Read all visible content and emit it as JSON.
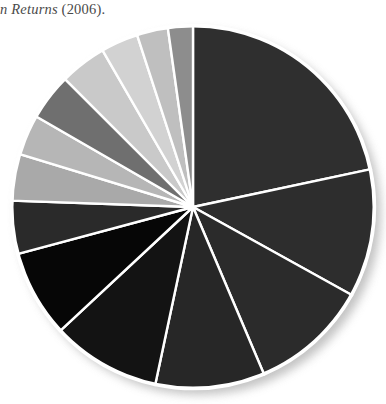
{
  "caption": {
    "italic_part": "n Returns",
    "plain_part": " (2006)."
  },
  "figure": {
    "name": "grayscale-pie-chart",
    "center_x": 186,
    "center_y": 186,
    "radius": 182,
    "divider_color": "#ffffff",
    "divider_width": 2.4,
    "rim_color": "#ffffff",
    "background": "#ffffff",
    "shadow_color": "#b9b9b9"
  },
  "chart_data": {
    "type": "pie",
    "title": "",
    "subtitle": "",
    "xlabel": "",
    "ylabel": "",
    "legend_position": "none",
    "grid": false,
    "start_angle_deg": 0,
    "direction": "clockwise",
    "units": "percent",
    "total": 100,
    "categories": [
      "Slice 1",
      "Slice 2",
      "Slice 3",
      "Slice 4",
      "Slice 5",
      "Slice 6",
      "Slice 7",
      "Slice 8",
      "Slice 9",
      "Slice 10",
      "Slice 11",
      "Slice 12",
      "Slice 13"
    ],
    "values": [
      21.7,
      11.4,
      10.6,
      9.7,
      9.7,
      7.8,
      4.7,
      4.2,
      3.6,
      4.2,
      4.2,
      3.3,
      2.8
    ],
    "angles_deg": [
      78.0,
      41.0,
      38.0,
      35.0,
      35.0,
      28.0,
      17.0,
      15.0,
      13.0,
      15.0,
      15.0,
      12.0,
      10.0
    ],
    "boundaries_deg": [
      0,
      78,
      119,
      157,
      192,
      227,
      255,
      272,
      287,
      300,
      315,
      330,
      342,
      352
    ],
    "colors": [
      "#2f2f2f",
      "#2d2d2d",
      "#2b2b2b",
      "#272727",
      "#1a1a1a",
      "#070707",
      "#262626",
      "#a8a8a8",
      "#b5b5b5",
      "#6d6d6d",
      "#c8c8c8",
      "#cdcdcd",
      "#bdbdbd",
      "#8e8e8e"
    ],
    "slices": [
      {
        "label": "Slice 1",
        "value": 21.7,
        "angle_deg": 78.0,
        "start_deg": 0,
        "end_deg": 78,
        "color": "#2f2f2f"
      },
      {
        "label": "Slice 2",
        "value": 11.4,
        "angle_deg": 41.0,
        "start_deg": 78,
        "end_deg": 119,
        "color": "#2d2d2d"
      },
      {
        "label": "Slice 3",
        "value": 10.6,
        "angle_deg": 38.0,
        "start_deg": 119,
        "end_deg": 157,
        "color": "#2b2b2b"
      },
      {
        "label": "Slice 4",
        "value": 9.7,
        "angle_deg": 35.0,
        "start_deg": 157,
        "end_deg": 192,
        "color": "#272727"
      },
      {
        "label": "Slice 5",
        "value": 9.7,
        "angle_deg": 35.0,
        "start_deg": 192,
        "end_deg": 227,
        "color": "#131313"
      },
      {
        "label": "Slice 6",
        "value": 7.8,
        "angle_deg": 28.0,
        "start_deg": 227,
        "end_deg": 255,
        "color": "#060606"
      },
      {
        "label": "Slice 7",
        "value": 4.7,
        "angle_deg": 17.0,
        "start_deg": 255,
        "end_deg": 272,
        "color": "#2a2a2a"
      },
      {
        "label": "Slice 8",
        "value": 4.2,
        "angle_deg": 15.0,
        "start_deg": 272,
        "end_deg": 287,
        "color": "#a9a9a9"
      },
      {
        "label": "Slice 9",
        "value": 3.6,
        "angle_deg": 13.0,
        "start_deg": 287,
        "end_deg": 300,
        "color": "#b6b6b6"
      },
      {
        "label": "Slice 10",
        "value": 4.2,
        "angle_deg": 15.0,
        "start_deg": 300,
        "end_deg": 315,
        "color": "#6f6f6f"
      },
      {
        "label": "Slice 11",
        "value": 4.2,
        "angle_deg": 15.0,
        "start_deg": 315,
        "end_deg": 330,
        "color": "#c9c9c9"
      },
      {
        "label": "Slice 12",
        "value": 3.3,
        "angle_deg": 12.0,
        "start_deg": 330,
        "end_deg": 342,
        "color": "#d2d2d2"
      },
      {
        "label": "Slice 13",
        "value": 2.8,
        "angle_deg": 10.0,
        "start_deg": 342,
        "end_deg": 352,
        "color": "#bfbfbf"
      },
      {
        "label": "Slice 14",
        "value": 2.2,
        "angle_deg": 8.0,
        "start_deg": 352,
        "end_deg": 360,
        "color": "#8d8d8d"
      }
    ]
  }
}
